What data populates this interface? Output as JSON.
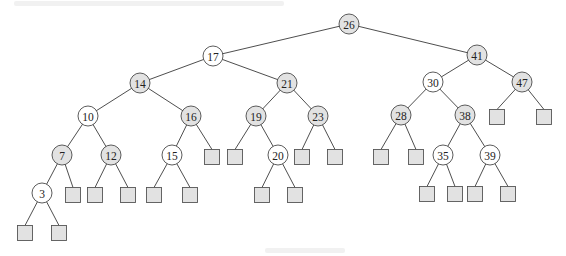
{
  "diagram": {
    "type": "red-black-tree",
    "legend": {
      "gray_node_color": "#e2e2e2",
      "white_node_color": "#ffffff",
      "leaf_color": "#e2e2e2"
    },
    "nodes": [
      {
        "id": "n26",
        "key": "26",
        "shade": "gray",
        "x": 349,
        "y": 24
      },
      {
        "id": "n17",
        "key": "17",
        "shade": "white",
        "x": 213,
        "y": 56
      },
      {
        "id": "n41",
        "key": "41",
        "shade": "gray",
        "x": 477,
        "y": 55
      },
      {
        "id": "n14",
        "key": "14",
        "shade": "gray",
        "x": 140,
        "y": 83
      },
      {
        "id": "n21",
        "key": "21",
        "shade": "gray",
        "x": 287,
        "y": 83
      },
      {
        "id": "n30",
        "key": "30",
        "shade": "white",
        "x": 433,
        "y": 82
      },
      {
        "id": "n47",
        "key": "47",
        "shade": "gray",
        "x": 522,
        "y": 82
      },
      {
        "id": "n10",
        "key": "10",
        "shade": "white",
        "x": 88,
        "y": 116
      },
      {
        "id": "n16",
        "key": "16",
        "shade": "gray",
        "x": 191,
        "y": 116
      },
      {
        "id": "n19",
        "key": "19",
        "shade": "gray",
        "x": 256,
        "y": 116
      },
      {
        "id": "n23",
        "key": "23",
        "shade": "gray",
        "x": 318,
        "y": 116
      },
      {
        "id": "n28",
        "key": "28",
        "shade": "gray",
        "x": 401,
        "y": 115
      },
      {
        "id": "n38",
        "key": "38",
        "shade": "gray",
        "x": 465,
        "y": 115
      },
      {
        "id": "n7",
        "key": "7",
        "shade": "gray",
        "x": 62,
        "y": 155
      },
      {
        "id": "n12",
        "key": "12",
        "shade": "gray",
        "x": 111,
        "y": 155
      },
      {
        "id": "n15",
        "key": "15",
        "shade": "white",
        "x": 172,
        "y": 155
      },
      {
        "id": "n20",
        "key": "20",
        "shade": "white",
        "x": 278,
        "y": 155
      },
      {
        "id": "n35",
        "key": "35",
        "shade": "white",
        "x": 443,
        "y": 155
      },
      {
        "id": "n39",
        "key": "39",
        "shade": "white",
        "x": 490,
        "y": 155
      },
      {
        "id": "n3",
        "key": "3",
        "shade": "white",
        "x": 42,
        "y": 193
      }
    ],
    "edges": [
      [
        "n26",
        "n17"
      ],
      [
        "n26",
        "n41"
      ],
      [
        "n17",
        "n14"
      ],
      [
        "n17",
        "n21"
      ],
      [
        "n41",
        "n30"
      ],
      [
        "n41",
        "n47"
      ],
      [
        "n14",
        "n10"
      ],
      [
        "n14",
        "n16"
      ],
      [
        "n21",
        "n19"
      ],
      [
        "n21",
        "n23"
      ],
      [
        "n30",
        "n28"
      ],
      [
        "n30",
        "n38"
      ],
      [
        "n10",
        "n7"
      ],
      [
        "n10",
        "n12"
      ],
      [
        "n16",
        "n15"
      ],
      [
        "n19",
        "n20"
      ],
      [
        "n38",
        "n35"
      ],
      [
        "n38",
        "n39"
      ],
      [
        "n7",
        "n3"
      ]
    ],
    "leaves": [
      {
        "parent": "n16",
        "x": 212,
        "y": 157
      },
      {
        "parent": "n19",
        "x": 235,
        "y": 157
      },
      {
        "parent": "n23",
        "x": 302,
        "y": 157
      },
      {
        "parent": "n23",
        "x": 335,
        "y": 157
      },
      {
        "parent": "n28",
        "x": 381,
        "y": 157
      },
      {
        "parent": "n28",
        "x": 416,
        "y": 157
      },
      {
        "parent": "n47",
        "x": 497,
        "y": 117
      },
      {
        "parent": "n47",
        "x": 544,
        "y": 117
      },
      {
        "parent": "n7",
        "x": 73,
        "y": 195
      },
      {
        "parent": "n12",
        "x": 95,
        "y": 195
      },
      {
        "parent": "n12",
        "x": 128,
        "y": 195
      },
      {
        "parent": "n15",
        "x": 154,
        "y": 195
      },
      {
        "parent": "n15",
        "x": 190,
        "y": 195
      },
      {
        "parent": "n20",
        "x": 262,
        "y": 195
      },
      {
        "parent": "n20",
        "x": 295,
        "y": 195
      },
      {
        "parent": "n35",
        "x": 427,
        "y": 194
      },
      {
        "parent": "n35",
        "x": 455,
        "y": 194
      },
      {
        "parent": "n39",
        "x": 475,
        "y": 194
      },
      {
        "parent": "n39",
        "x": 508,
        "y": 194
      },
      {
        "parent": "n3",
        "x": 25,
        "y": 233
      },
      {
        "parent": "n3",
        "x": 59,
        "y": 233
      }
    ],
    "node_radius": 10,
    "leaf_size": 15
  }
}
